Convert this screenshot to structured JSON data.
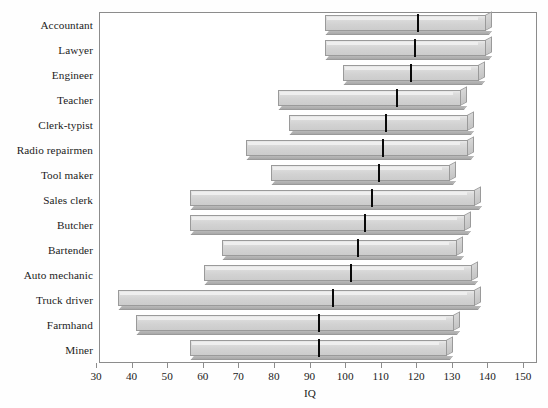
{
  "chart_data": {
    "type": "bar",
    "subtype": "horizontal-range",
    "title": "",
    "xlabel": "IQ",
    "ylabel": "",
    "xlim": [
      30,
      150
    ],
    "xticks": [
      30,
      40,
      50,
      60,
      70,
      80,
      90,
      100,
      110,
      120,
      130,
      140,
      150
    ],
    "xtick_labels": [
      "30",
      "40",
      "50",
      "60",
      "70",
      "80",
      "90",
      "100",
      "110",
      "120",
      "130",
      "140",
      "150"
    ],
    "grid": false,
    "legend": null,
    "categories": [
      "Accountant",
      "Lawyer",
      "Engineer",
      "Teacher",
      "Clerk-typist",
      "Radio repairmen",
      "Tool maker",
      "Sales clerk",
      "Butcher",
      "Bartender",
      "Auto mechanic",
      "Truck driver",
      "Farmhand",
      "Miner"
    ],
    "series": [
      {
        "name": "IQ range",
        "low": [
          94,
          94,
          99,
          81,
          84,
          72,
          79,
          56,
          56,
          65,
          60,
          36,
          41,
          56
        ],
        "median": [
          120,
          119,
          118,
          114,
          111,
          110,
          109,
          107,
          105,
          103,
          101,
          96,
          92,
          92
        ],
        "high": [
          141,
          141,
          139,
          134,
          136,
          136,
          131,
          138,
          135,
          133,
          137,
          138,
          132,
          130
        ]
      }
    ],
    "bar_colors": {
      "face_light": "#e9e9e9",
      "face_dark": "#cccccc",
      "edge": "#9a9a9a",
      "shadow": "#a8a8a8",
      "median": "#0a0a0a"
    },
    "frame_color": "#8c8c8c",
    "text_color": "#1b1b1b",
    "background": "#ffffff"
  }
}
